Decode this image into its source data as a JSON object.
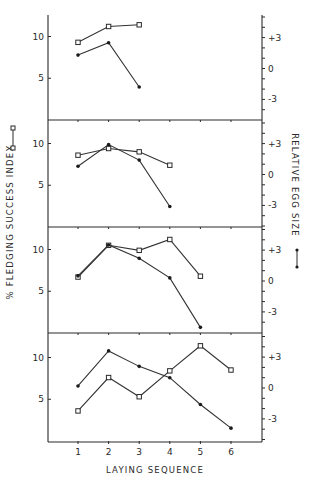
{
  "chart_data": {
    "type": "line",
    "layout": "4 stacked panels sharing x-axis, dual y-axes",
    "xlabel": "LAYING SEQUENCE",
    "ylabel_left": "% FLEDGING SUCCESS INDEX",
    "ylabel_right": "RELATIVE EGG SIZE",
    "legend": {
      "left_axis_series_marker": "open-square",
      "right_axis_series_marker": "filled-dot"
    },
    "x_ticks": [
      "1",
      "2",
      "3",
      "4",
      "5",
      "6"
    ],
    "y_left_ticks": [
      "5",
      "10"
    ],
    "y_right_ticks": [
      "-3",
      "0",
      "+3"
    ],
    "y_left_range": [
      0,
      12.5
    ],
    "y_right_range": [
      -5,
      5
    ],
    "grid": false,
    "panels": [
      {
        "name": "panel-1",
        "series": [
          {
            "name": "% Fledging Success Index",
            "marker": "square",
            "x": [
              1,
              2,
              3
            ],
            "values": [
              9.3,
              11.2,
              11.4
            ]
          },
          {
            "name": "Relative Egg Size",
            "marker": "dot",
            "x": [
              1,
              2,
              3
            ],
            "values": [
              1.3,
              2.5,
              -1.8
            ]
          }
        ]
      },
      {
        "name": "panel-2",
        "series": [
          {
            "name": "% Fledging Success Index",
            "marker": "square",
            "x": [
              1,
              2,
              3,
              4
            ],
            "values": [
              8.6,
              9.4,
              9.0,
              7.4
            ]
          },
          {
            "name": "Relative Egg Size",
            "marker": "dot",
            "x": [
              1,
              2,
              3,
              4
            ],
            "values": [
              0.8,
              2.9,
              1.4,
              -3.1
            ]
          }
        ]
      },
      {
        "name": "panel-3",
        "series": [
          {
            "name": "% Fledging Success Index",
            "marker": "square",
            "x": [
              1,
              2,
              3,
              4,
              5
            ],
            "values": [
              6.7,
              10.5,
              9.9,
              11.2,
              6.8
            ]
          },
          {
            "name": "Relative Egg Size",
            "marker": "dot",
            "x": [
              1,
              2,
              3,
              4,
              5
            ],
            "values": [
              0.5,
              3.5,
              2.2,
              0.3,
              -4.5
            ]
          }
        ]
      },
      {
        "name": "panel-4",
        "series": [
          {
            "name": "% Fledging Success Index",
            "marker": "square",
            "x": [
              1,
              2,
              3,
              4,
              5,
              6
            ],
            "values": [
              3.6,
              7.6,
              5.3,
              8.4,
              11.4,
              8.5
            ]
          },
          {
            "name": "Relative Egg Size",
            "marker": "dot",
            "x": [
              1,
              2,
              3,
              4,
              5,
              6
            ],
            "values": [
              0.2,
              3.6,
              2.1,
              1.0,
              -1.6,
              -3.9
            ]
          }
        ]
      }
    ]
  },
  "labels": {
    "xlabel": "LAYING SEQUENCE",
    "ylabel_left": "% FLEDGING SUCCESS INDEX",
    "ylabel_right": "RELATIVE EGG SIZE",
    "x_ticks": [
      "1",
      "2",
      "3",
      "4",
      "5",
      "6"
    ],
    "y_left": {
      "t10": "10",
      "t5": "5"
    },
    "y_right": {
      "tp3": "+3",
      "t0": "0",
      "tm3": "-3"
    }
  }
}
